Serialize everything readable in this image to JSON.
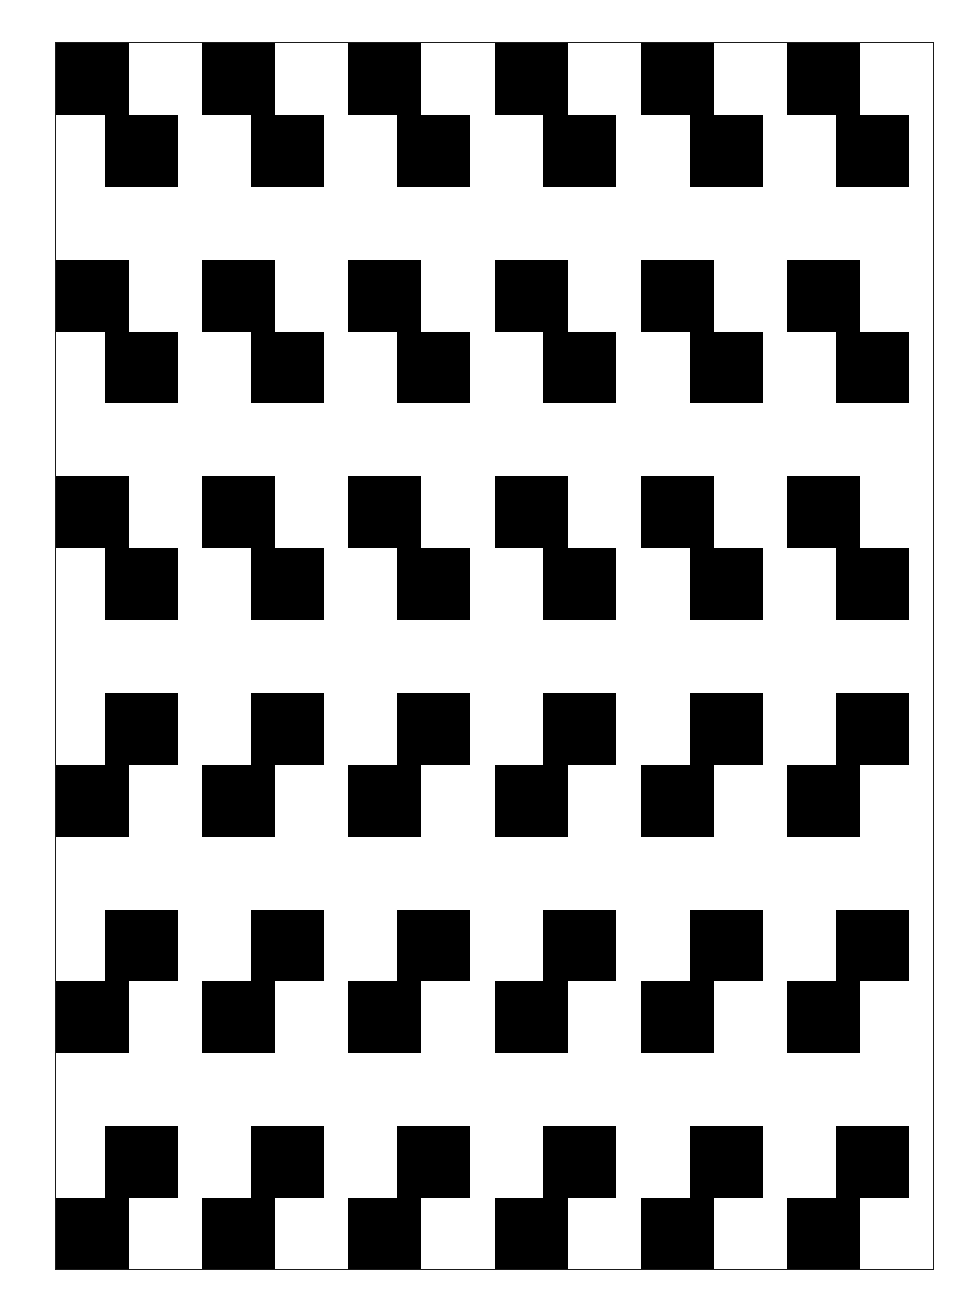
{
  "artwork": {
    "title": "Offset checkerboard square pattern",
    "description": "High-contrast black and white geometric pattern of offset square blocks arranged in six horizontal bands inside a thin rectangular frame",
    "style": "op-art / halftone test pattern",
    "colors": {
      "ink": "#000000",
      "paper": "#ffffff",
      "frame_stroke": "#1a1a1a"
    },
    "canvas": {
      "width": 973,
      "height": 1311,
      "background": "#ffffff"
    },
    "frame": {
      "x": 55,
      "y": 42,
      "width": 879,
      "height": 1228,
      "stroke_width": 1
    },
    "geometry": {
      "cell_width": 73.25,
      "cell_height": 72,
      "columns": 12,
      "offset_x": 49,
      "band_count": 6,
      "band_rows": 2,
      "band_pitch": 217,
      "first_band_top": 0
    },
    "bands": [
      {
        "index": 1,
        "top": 0,
        "orientation": "normal",
        "rows": [
          {
            "role": "aligned-checker",
            "kind": "checker",
            "phase": 0,
            "squares": 6
          },
          {
            "role": "offset-blocks",
            "kind": "offset",
            "phase": 0,
            "squares": 6
          }
        ]
      },
      {
        "index": 2,
        "top": 217,
        "orientation": "normal",
        "rows": [
          {
            "role": "aligned-blocks",
            "kind": "aligned",
            "phase": 0,
            "squares": 6
          },
          {
            "role": "offset-blocks",
            "kind": "offset",
            "phase": 0,
            "squares": 6
          }
        ]
      },
      {
        "index": 3,
        "top": 434,
        "orientation": "normal",
        "rows": [
          {
            "role": "aligned-blocks",
            "kind": "aligned",
            "phase": 0,
            "squares": 6
          },
          {
            "role": "offset-blocks",
            "kind": "offset",
            "phase": 0,
            "squares": 6
          }
        ]
      },
      {
        "index": 4,
        "top": 651,
        "orientation": "mirrored",
        "rows": [
          {
            "role": "offset-blocks",
            "kind": "offset",
            "phase": 0,
            "squares": 6
          },
          {
            "role": "aligned-blocks",
            "kind": "aligned",
            "phase": 0,
            "squares": 6
          }
        ]
      },
      {
        "index": 5,
        "top": 868,
        "orientation": "mirrored",
        "rows": [
          {
            "role": "offset-blocks",
            "kind": "offset",
            "phase": 0,
            "squares": 6
          },
          {
            "role": "aligned-blocks",
            "kind": "aligned",
            "phase": 0,
            "squares": 6
          }
        ]
      },
      {
        "index": 6,
        "top": 1085,
        "orientation": "mirrored",
        "rows": [
          {
            "role": "offset-blocks",
            "kind": "offset",
            "phase": 0,
            "squares": 6
          },
          {
            "role": "aligned-checker",
            "kind": "checker",
            "phase": 0,
            "squares": 6
          }
        ]
      }
    ]
  }
}
